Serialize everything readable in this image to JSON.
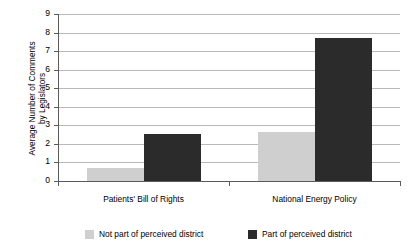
{
  "chart_data": {
    "type": "bar",
    "title": "",
    "xlabel": "",
    "ylabel": "Average Number of Comments by Legislators",
    "ylabel_line1": "Average Number of Comments",
    "ylabel_line2": "by Legislators",
    "ylim": [
      0,
      9
    ],
    "ytick_values": [
      9,
      8,
      7,
      6,
      5,
      4,
      3,
      2,
      1,
      0
    ],
    "ytick_labels": [
      "9",
      "8",
      "7",
      "6",
      "5",
      "4",
      "3",
      "2",
      "1",
      "0"
    ],
    "grid": true,
    "legend_position": "bottom",
    "categories": [
      "Patients' Bill of Rights",
      "National Energy Policy"
    ],
    "series": [
      {
        "name": "Not part of perceived district",
        "color": "#cfcfcf",
        "values": [
          0.7,
          2.65
        ]
      },
      {
        "name": "Part of perceived district",
        "color": "#2b2b2b",
        "values": [
          2.55,
          7.7
        ]
      }
    ]
  },
  "axis": {
    "axis_color": "#5a5a5a",
    "grid_color": "#b9b9b9"
  },
  "legend": {
    "items": [
      {
        "label": "Not part of perceived district",
        "color": "#cfcfcf"
      },
      {
        "label": "Part of perceived district",
        "color": "#2b2b2b"
      }
    ]
  }
}
